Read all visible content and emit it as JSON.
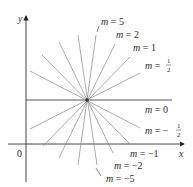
{
  "diagram": {
    "type": "family-of-lines",
    "axes": {
      "x_label": "x",
      "y_label": "y",
      "origin_label": "0"
    },
    "center_point": {
      "x": 87,
      "y": 100
    },
    "lines": [
      {
        "slope_label": "m = 5",
        "m": 5
      },
      {
        "slope_label": "m = 2",
        "m": 2
      },
      {
        "slope_label": "m = 1",
        "m": 1
      },
      {
        "slope_label": "m = 1/2",
        "m": 0.5
      },
      {
        "slope_label": "m = 0",
        "m": 0
      },
      {
        "slope_label": "m = −1/2",
        "m": -0.5
      },
      {
        "slope_label": "m = −1",
        "m": -1
      },
      {
        "slope_label": "m = −2",
        "m": -2
      },
      {
        "slope_label": "m = −5",
        "m": -5
      }
    ],
    "labels": {
      "m5": {
        "prefix": "m",
        "eq": " = ",
        "value": "5"
      },
      "m2": {
        "prefix": "m",
        "eq": " = ",
        "value": "2"
      },
      "m1": {
        "prefix": "m",
        "eq": " = ",
        "value": "1"
      },
      "mhalf": {
        "prefix": "m",
        "eq": " = ",
        "num": "1",
        "den": "2"
      },
      "m0": {
        "prefix": "m",
        "eq": " = ",
        "value": "0"
      },
      "mneghalf": {
        "prefix": "m",
        "eq": " = −",
        "num": "1",
        "den": "2"
      },
      "mneg1": {
        "prefix": "m",
        "eq": " = ",
        "value": "−1"
      },
      "mneg2": {
        "prefix": "m",
        "eq": " = ",
        "value": "−2"
      },
      "mneg5": {
        "prefix": "m",
        "eq": " = ",
        "value": "−5"
      }
    }
  }
}
